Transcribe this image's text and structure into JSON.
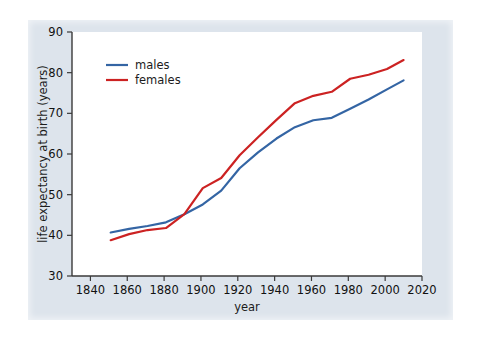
{
  "figure": {
    "background_color": "#dde4ec",
    "plot_background_color": "#ffffff",
    "outer_background_color": "#ffffff",
    "axis_color": "#3a3a3a"
  },
  "chart_data": {
    "type": "line",
    "title": "",
    "xlabel": "year",
    "ylabel": "life expectancy at birth (years)",
    "xlim": [
      1830,
      2020
    ],
    "ylim": [
      30,
      90
    ],
    "xticks": [
      1840,
      1860,
      1880,
      1900,
      1920,
      1940,
      1960,
      1980,
      2000,
      2020
    ],
    "xtick_labels": [
      "1840",
      "1860",
      "1880",
      "1900",
      "1920",
      "1940",
      "1960",
      "1980",
      "2000",
      "2020"
    ],
    "yticks": [
      30,
      40,
      50,
      60,
      70,
      80,
      90
    ],
    "ytick_labels": [
      "30",
      "40",
      "50",
      "60",
      "70",
      "80",
      "90"
    ],
    "grid": false,
    "legend_position": "upper left",
    "series": [
      {
        "name": "males",
        "color": "#3465a4",
        "x": [
          1851,
          1861,
          1871,
          1881,
          1891,
          1901,
          1911,
          1921,
          1931,
          1941,
          1951,
          1961,
          1971,
          1981,
          1991,
          2001,
          2010
        ],
        "values": [
          40.7,
          41.6,
          42.3,
          43.2,
          45.2,
          47.6,
          51.0,
          56.5,
          60.4,
          63.8,
          66.6,
          68.3,
          68.9,
          71.1,
          73.4,
          75.9,
          78.1
        ]
      },
      {
        "name": "females",
        "color": "#cc2222",
        "x": [
          1851,
          1861,
          1871,
          1881,
          1891,
          1901,
          1911,
          1921,
          1931,
          1941,
          1951,
          1961,
          1971,
          1981,
          1991,
          2001,
          2010
        ],
        "values": [
          38.8,
          40.3,
          41.3,
          41.8,
          45.2,
          51.6,
          54.1,
          59.7,
          64.1,
          68.4,
          72.5,
          74.3,
          75.3,
          78.5,
          79.5,
          80.9,
          83.1
        ]
      }
    ]
  },
  "legend": {
    "entries": [
      {
        "label": "males",
        "color": "#3465a4"
      },
      {
        "label": "females",
        "color": "#cc2222"
      }
    ]
  }
}
